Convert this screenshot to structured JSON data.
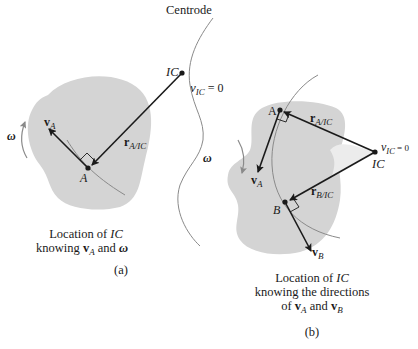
{
  "figure": {
    "centrode_label": "Centrode",
    "colors": {
      "body_fill": "#d4d4d4",
      "light_region": "#e9e9e9",
      "line": "#1a1a1a",
      "curve": "#8a8a8a",
      "omega_arrow": "#8a8a8a"
    },
    "panel_a": {
      "ic_label": "IC",
      "v_ic_label": "v",
      "v_ic_sub": "IC",
      "v_ic_eq": " = 0",
      "point_a": "A",
      "va_label": "v",
      "va_sub": "A",
      "r_label": "r",
      "r_sub": "A/IC",
      "omega": "ω",
      "caption_line1_pre": "Location of ",
      "caption_line1_it": "IC",
      "caption_line2_pre": "knowing ",
      "caption_line2_v": "v",
      "caption_line2_sub": "A",
      "caption_line2_mid": " and ",
      "caption_line2_omega": "ω",
      "tag": "(a)"
    },
    "panel_b": {
      "ic_label": "IC",
      "v_ic_label": "v",
      "v_ic_sub": "IC",
      "v_ic_eq": " = 0",
      "point_a": "A",
      "point_b": "B",
      "va_label": "v",
      "va_sub": "A",
      "vb_label": "v",
      "vb_sub": "B",
      "ra_label": "r",
      "ra_sub": "A/IC",
      "rb_label": "r",
      "rb_sub": "B/IC",
      "omega": "ω",
      "caption_line1_pre": "Location of ",
      "caption_line1_it": "IC",
      "caption_line2": "knowing the directions",
      "caption_line3_pre": "of ",
      "caption_line3_v1": "v",
      "caption_line3_sub1": "A",
      "caption_line3_mid": " and ",
      "caption_line3_v2": "v",
      "caption_line3_sub2": "B",
      "tag": "(b)"
    }
  }
}
